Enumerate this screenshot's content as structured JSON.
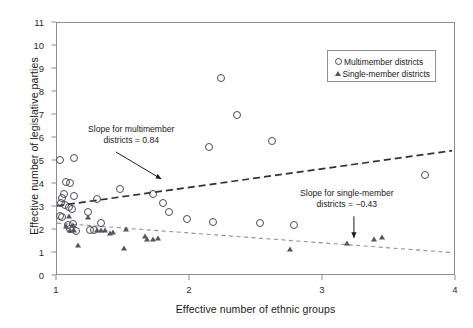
{
  "chart_data": {
    "type": "scatter",
    "title": "",
    "xlabel": "Effective number of ethnic groups",
    "ylabel": "Effective number of legislative parties",
    "xlim": [
      1,
      4
    ],
    "ylim": [
      0,
      11
    ],
    "xticks": [
      1,
      2,
      3,
      4
    ],
    "yticks": [
      0,
      1,
      2,
      3,
      4,
      5,
      6,
      7,
      8,
      9,
      10,
      11
    ],
    "grid": false,
    "legend_position": "top-right",
    "series": [
      {
        "name": "Multimember districts",
        "marker": "open-circle",
        "color": "#4a4a54",
        "points": [
          [
            1.02,
            5.05
          ],
          [
            1.13,
            5.12
          ],
          [
            1.07,
            4.08
          ],
          [
            1.1,
            4.05
          ],
          [
            1.05,
            3.55
          ],
          [
            1.13,
            3.5
          ],
          [
            1.04,
            3.4
          ],
          [
            1.03,
            3.18
          ],
          [
            1.06,
            3.1
          ],
          [
            1.09,
            3.02
          ],
          [
            1.11,
            2.92
          ],
          [
            1.02,
            2.6
          ],
          [
            1.04,
            2.58
          ],
          [
            1.08,
            2.22
          ],
          [
            1.12,
            2.25
          ],
          [
            1.1,
            2.05
          ],
          [
            1.14,
            1.95
          ],
          [
            1.23,
            2.78
          ],
          [
            1.3,
            3.35
          ],
          [
            1.33,
            2.3
          ],
          [
            1.25,
            2.02
          ],
          [
            1.28,
            1.98
          ],
          [
            1.47,
            3.8
          ],
          [
            1.72,
            3.55
          ],
          [
            1.8,
            3.18
          ],
          [
            1.84,
            2.8
          ],
          [
            1.98,
            2.5
          ],
          [
            2.14,
            5.6
          ],
          [
            2.23,
            8.6
          ],
          [
            2.35,
            7.0
          ],
          [
            2.62,
            5.85
          ],
          [
            2.17,
            2.35
          ],
          [
            2.53,
            2.3
          ],
          [
            2.78,
            2.22
          ],
          [
            3.77,
            4.4
          ]
        ]
      },
      {
        "name": "Single-member districts",
        "marker": "filled-triangle",
        "color": "#55555f",
        "points": [
          [
            1.09,
            2.6
          ],
          [
            1.12,
            2.22
          ],
          [
            1.07,
            2.18
          ],
          [
            1.1,
            2.02
          ],
          [
            1.13,
            1.98
          ],
          [
            1.16,
            1.35
          ],
          [
            1.23,
            2.58
          ],
          [
            1.3,
            2.02
          ],
          [
            1.33,
            2.0
          ],
          [
            1.36,
            1.98
          ],
          [
            1.4,
            1.88
          ],
          [
            1.42,
            1.9
          ],
          [
            1.52,
            2.05
          ],
          [
            1.5,
            1.22
          ],
          [
            1.66,
            1.72
          ],
          [
            1.68,
            1.62
          ],
          [
            1.72,
            1.6
          ],
          [
            1.76,
            1.65
          ],
          [
            2.75,
            1.18
          ],
          [
            3.18,
            1.45
          ],
          [
            3.38,
            1.62
          ],
          [
            3.44,
            1.68
          ]
        ]
      }
    ],
    "trendlines": [
      {
        "name": "Multimember districts trend",
        "slope": 0.84,
        "style": "dashed",
        "color": "#2f2f3a",
        "x0": 1.0,
        "y0": 3.05,
        "x1": 3.97,
        "y1": 5.45
      },
      {
        "name": "Single-member districts trend",
        "slope": -0.43,
        "style": "dashed",
        "color": "#8f8f97",
        "x0": 1.0,
        "y0": 2.3,
        "x1": 3.97,
        "y1": 1.02
      }
    ],
    "annotations": [
      {
        "id": "multimember",
        "line1": "Slope for multimember",
        "line2": "districts = 0.84",
        "arrow_from": [
          1.45,
          5.35
        ],
        "arrow_to": [
          1.79,
          4.18
        ]
      },
      {
        "id": "single-member",
        "line1": "Slope for single-member",
        "line2": "districts = −0.43",
        "arrow_from": [
          3.24,
          2.55
        ],
        "arrow_to": [
          3.24,
          1.62
        ]
      }
    ],
    "legend": [
      {
        "label": "Multimember districts",
        "marker": "open-circle"
      },
      {
        "label": "Single-member districts",
        "marker": "filled-triangle"
      }
    ]
  }
}
